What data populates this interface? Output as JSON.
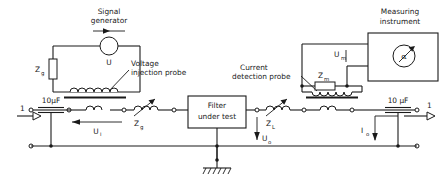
{
  "diagram": {
    "labels": {
      "signal_generator": "Signal\ngenerator",
      "signal_generator_l1": "Signal",
      "signal_generator_l2": "generator",
      "source_symbol": "U",
      "source_impedance": "Z",
      "source_impedance_sub": "g",
      "voltage_injection_probe_l1": "Voltage",
      "voltage_injection_probe_l2": "injection probe",
      "cap_left": "10µF",
      "cap_right": "10 µF",
      "terminal_left": "1",
      "terminal_right": "1",
      "injected_voltage": "U",
      "injected_voltage_sub": "i",
      "gen_side_impedance": "Z",
      "gen_side_impedance_sub": "g",
      "filter_l1": "Filter",
      "filter_l2": "under test",
      "load_impedance": "Z",
      "load_impedance_sub": "L",
      "output_voltage": "U",
      "output_voltage_sub": "o",
      "current_detection_probe_l1": "Current",
      "current_detection_probe_l2": "detection probe",
      "measuring_impedance": "Z",
      "measuring_impedance_sub": "m",
      "measured_voltage": "U",
      "measured_voltage_sub": "m",
      "output_current": "I",
      "output_current_sub": "o",
      "measuring_instrument_l1": "Measuring",
      "measuring_instrument_l2": "instrument",
      "meter_reading": "α"
    },
    "colors": {
      "line": "#1a1a1a",
      "background": "#ffffff",
      "fill": "#ffffff"
    }
  }
}
